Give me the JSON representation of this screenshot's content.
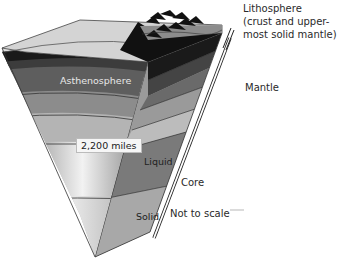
{
  "diagram": {
    "labels": {
      "lithosphere": "Lithosphere",
      "lithosphere_desc_line1": "(crust and upper-",
      "lithosphere_desc_line2": "most solid mantle)",
      "mantle": "Mantle",
      "asthenosphere": "Asthenosphere",
      "core": "Core",
      "liquid": "Liquid",
      "solid": "Solid",
      "scale_note": "Not to scale",
      "depth": "2,200 miles"
    },
    "layers": [
      {
        "name": "Crust surface",
        "color": "#cfcfcf"
      },
      {
        "name": "Lithosphere",
        "color": "#1c1c1c"
      },
      {
        "name": "Asthenosphere",
        "color": "#5e5e5e"
      },
      {
        "name": "Upper mantle",
        "color": "#8a8a8a"
      },
      {
        "name": "Lower mantle",
        "color": "#b4b4b4"
      },
      {
        "name": "Outer core (liquid)",
        "color": "#7a7a7a"
      },
      {
        "name": "Inner core (solid)",
        "color": "#a8a8a8"
      }
    ]
  }
}
